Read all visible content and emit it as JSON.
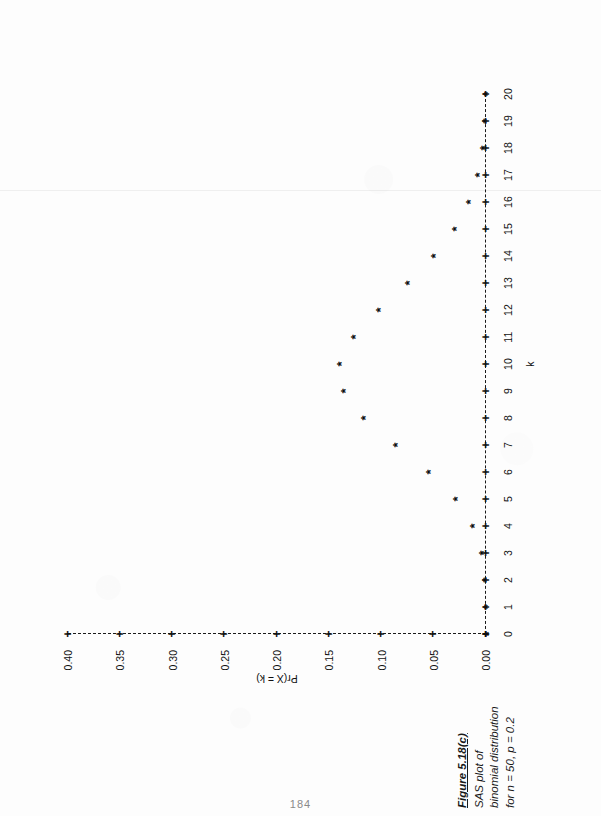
{
  "figure": {
    "caption_title": "Figure 5.18(c)",
    "caption_lines": [
      "SAS plot of",
      "binomial distribution",
      "for n = 50, p = 0.2"
    ],
    "page_number": "184",
    "orientation": "rotated-90-ccw"
  },
  "chart_data": {
    "type": "scatter",
    "title": "",
    "subtitle": "",
    "xlabel": "k",
    "ylabel": "Pr(X = k)",
    "marker": "*",
    "grid": false,
    "legend": null,
    "xlim": [
      0,
      20
    ],
    "ylim": [
      0.0,
      0.4
    ],
    "xticks": [
      0,
      1,
      2,
      3,
      4,
      5,
      6,
      7,
      8,
      9,
      10,
      11,
      12,
      13,
      14,
      15,
      16,
      17,
      18,
      19,
      20
    ],
    "xticklabels": [
      "0",
      "1",
      "2",
      "3",
      "4",
      "5",
      "6",
      "7",
      "8",
      "9",
      "10",
      "11",
      "12",
      "13",
      "14",
      "15",
      "16",
      "17",
      "18",
      "19",
      "20"
    ],
    "yticks": [
      0.0,
      0.05,
      0.1,
      0.15,
      0.2,
      0.25,
      0.3,
      0.35,
      0.4
    ],
    "yticklabels": [
      "0.00",
      "0.05",
      "0.10",
      "0.15",
      "0.20",
      "0.25",
      "0.30",
      "0.35",
      "0.40"
    ],
    "categories": [
      0,
      1,
      2,
      3,
      4,
      5,
      6,
      7,
      8,
      9,
      10,
      11,
      12,
      13,
      14,
      15,
      16,
      17,
      18,
      19,
      20
    ],
    "values": [
      0.0,
      0.0002,
      0.0011,
      0.0044,
      0.0128,
      0.0295,
      0.0554,
      0.087,
      0.1169,
      0.1364,
      0.1398,
      0.1271,
      0.1033,
      0.0755,
      0.0499,
      0.0299,
      0.0164,
      0.0082,
      0.0037,
      0.0016,
      0.0006
    ],
    "series": [
      {
        "name": "Pr(X = k)",
        "points": [
          {
            "k": 0,
            "p": 0.0
          },
          {
            "k": 1,
            "p": 0.0002
          },
          {
            "k": 2,
            "p": 0.0011
          },
          {
            "k": 3,
            "p": 0.0044
          },
          {
            "k": 4,
            "p": 0.0128
          },
          {
            "k": 5,
            "p": 0.0295
          },
          {
            "k": 6,
            "p": 0.0554
          },
          {
            "k": 7,
            "p": 0.087
          },
          {
            "k": 8,
            "p": 0.1169
          },
          {
            "k": 9,
            "p": 0.1364
          },
          {
            "k": 10,
            "p": 0.1398
          },
          {
            "k": 11,
            "p": 0.1271
          },
          {
            "k": 12,
            "p": 0.1033
          },
          {
            "k": 13,
            "p": 0.0755
          },
          {
            "k": 14,
            "p": 0.0499
          },
          {
            "k": 15,
            "p": 0.0299
          },
          {
            "k": 16,
            "p": 0.0164
          },
          {
            "k": 17,
            "p": 0.0082
          },
          {
            "k": 18,
            "p": 0.0037
          },
          {
            "k": 19,
            "p": 0.0016
          },
          {
            "k": 20,
            "p": 0.0006
          }
        ]
      }
    ],
    "distribution": {
      "n": 50,
      "p": 0.2
    }
  }
}
